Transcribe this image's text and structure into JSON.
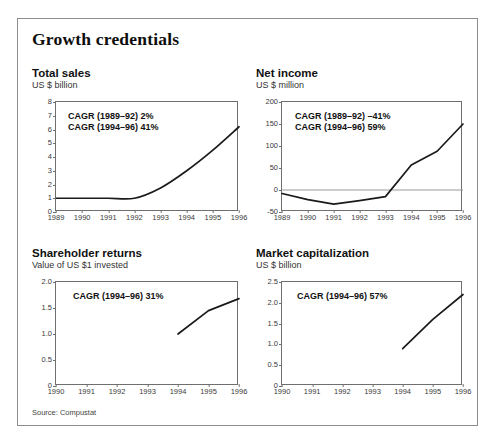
{
  "figure": {
    "title": "Growth credentials",
    "source": "Source: Compustat"
  },
  "panels": {
    "total_sales": {
      "title": "Total sales",
      "subtitle": "US $ billion",
      "annotations": [
        "CAGR (1989–92) 2%",
        "CAGR (1994–96) 41%"
      ]
    },
    "net_income": {
      "title": "Net income",
      "subtitle": "US $ million",
      "annotations": [
        "CAGR (1989–92) –41%",
        "CAGR (1994–96) 59%"
      ]
    },
    "shareholder_returns": {
      "title": "Shareholder returns",
      "subtitle": "Value of US $1 invested",
      "annotations": [
        "CAGR (1994–96) 31%"
      ]
    },
    "market_capitalization": {
      "title": "Market capitalization",
      "subtitle": "US $ billion",
      "annotations": [
        "CAGR (1994–96) 57%"
      ]
    }
  },
  "chart_data": [
    {
      "type": "line",
      "title": "Total sales",
      "ylabel": "US $ billion",
      "xlabel": "",
      "x": [
        1989,
        1990,
        1991,
        1992,
        1993,
        1994,
        1995,
        1996
      ],
      "values": [
        1.0,
        1.0,
        1.0,
        1.0,
        1.75,
        3.0,
        4.5,
        6.2
      ],
      "xticklabels": [
        "1989",
        "1990",
        "1991",
        "1992",
        "1993",
        "1994",
        "1995",
        "1996"
      ],
      "yticklabels": [
        "0",
        "1",
        "2",
        "3",
        "4",
        "5",
        "6",
        "7",
        "8"
      ],
      "ylim": [
        0,
        8
      ],
      "xlim": [
        1989,
        1996
      ],
      "grid": false,
      "legend": "none",
      "zero_line": false,
      "smooth": true,
      "annotations": [
        "CAGR (1989–92) 2%",
        "CAGR (1994–96) 41%"
      ]
    },
    {
      "type": "line",
      "title": "Net income",
      "ylabel": "US $ million",
      "xlabel": "",
      "x": [
        1989,
        1990,
        1991,
        1992,
        1993,
        1994,
        1995,
        1996
      ],
      "values": [
        -8,
        -22,
        -32,
        -24,
        -15,
        57,
        88,
        150
      ],
      "xticklabels": [
        "1989",
        "1990",
        "1991",
        "1992",
        "1993",
        "1994",
        "1995",
        "1996"
      ],
      "yticklabels": [
        "-50",
        "0",
        "50",
        "100",
        "150",
        "200"
      ],
      "ylim": [
        -50,
        200
      ],
      "xlim": [
        1989,
        1996
      ],
      "grid": false,
      "legend": "none",
      "zero_line": true,
      "smooth": false,
      "annotations": [
        "CAGR (1989–92) –41%",
        "CAGR (1994–96) 59%"
      ]
    },
    {
      "type": "line",
      "title": "Shareholder returns",
      "ylabel": "Value of US $1 invested",
      "xlabel": "",
      "x": [
        1994,
        1995,
        1996
      ],
      "values": [
        1.0,
        1.45,
        1.68
      ],
      "xticklabels": [
        "1990",
        "1991",
        "1992",
        "1993",
        "1994",
        "1995",
        "1996"
      ],
      "yticklabels": [
        "0",
        "0.5",
        "1.0",
        "1.5",
        "2.0"
      ],
      "ylim": [
        0,
        2.0
      ],
      "xlim": [
        1990,
        1996
      ],
      "grid": false,
      "legend": "none",
      "zero_line": false,
      "smooth": false,
      "annotations": [
        "CAGR (1994–96) 31%"
      ]
    },
    {
      "type": "line",
      "title": "Market capitalization",
      "ylabel": "US $ billion",
      "xlabel": "",
      "x": [
        1994,
        1995,
        1996
      ],
      "values": [
        0.9,
        1.6,
        2.2
      ],
      "xticklabels": [
        "1990",
        "1991",
        "1992",
        "1993",
        "1994",
        "1995",
        "1996"
      ],
      "yticklabels": [
        "0",
        "0.5",
        "1.0",
        "1.5",
        "2.0",
        "2.5"
      ],
      "ylim": [
        0,
        2.5
      ],
      "xlim": [
        1990,
        1996
      ],
      "grid": false,
      "legend": "none",
      "zero_line": false,
      "smooth": false,
      "annotations": [
        "CAGR (1994–96) 57%"
      ]
    }
  ]
}
